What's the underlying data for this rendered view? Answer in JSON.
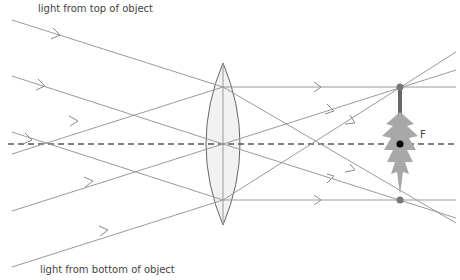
{
  "labels": {
    "top": "light from top of object",
    "bottom": "light from bottom of object",
    "focal_point": "F"
  },
  "colors": {
    "ray": "#9a9a9a",
    "axis": "#555555",
    "lens_stroke": "#666666",
    "lens_fill": "#f2f2f2",
    "image_point": "#777777",
    "focal_dot": "#000000",
    "tree": "#a8a8a8",
    "trunk": "#666666"
  },
  "geometry": {
    "axis_y": 144,
    "lens_x": 223,
    "lens_top": 63,
    "lens_bottom": 225,
    "image_x": 400,
    "image_top_y": 87,
    "image_bottom_y": 200
  }
}
